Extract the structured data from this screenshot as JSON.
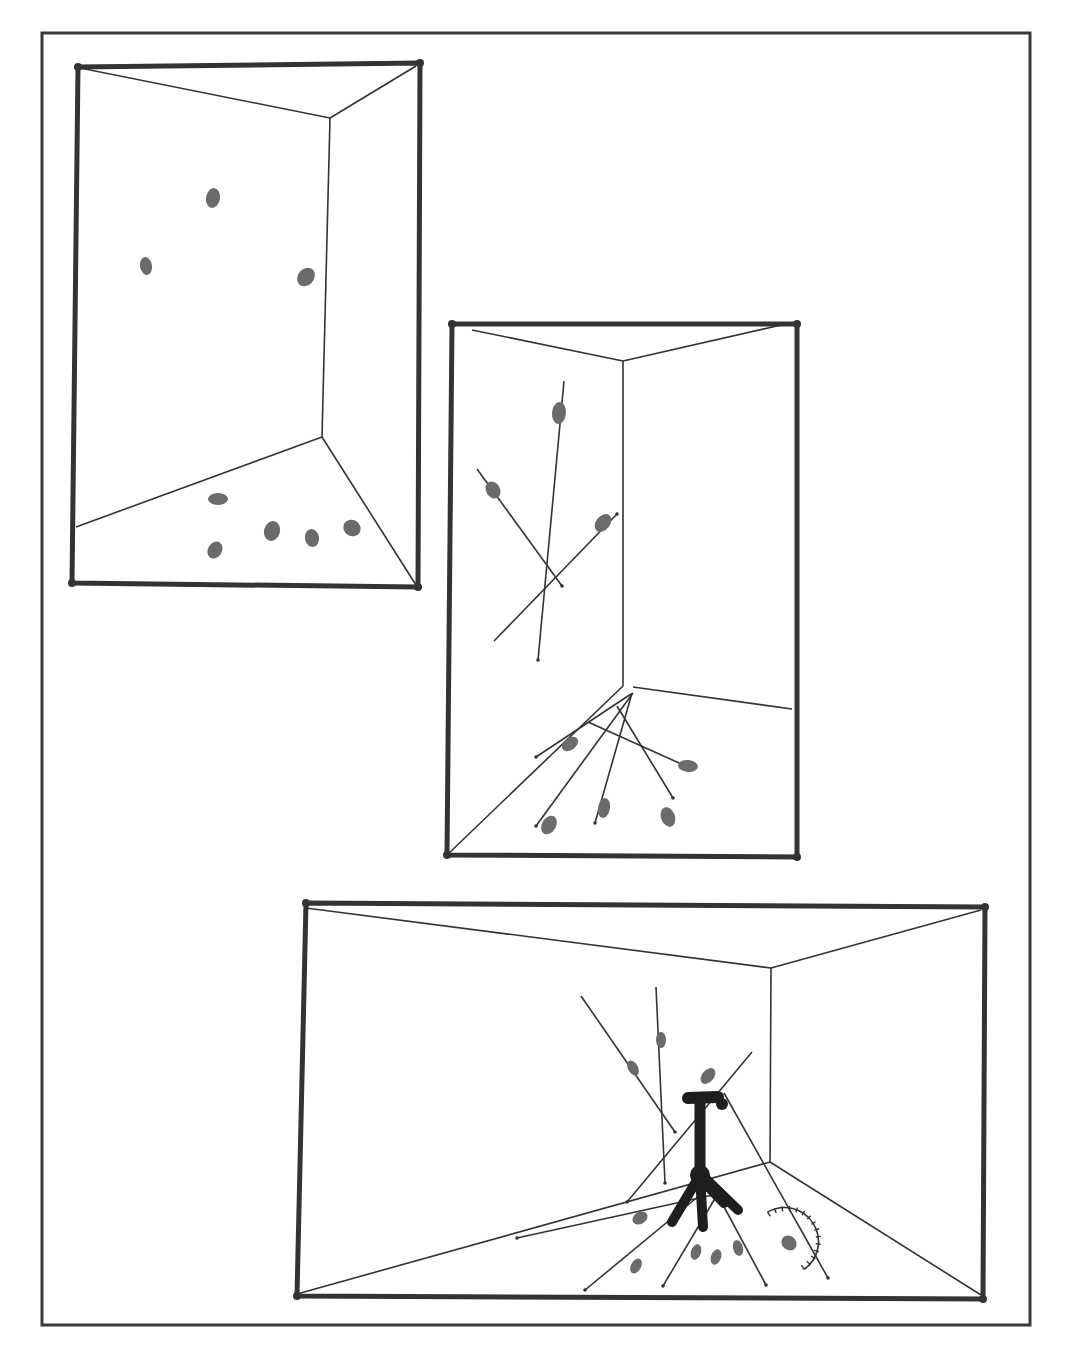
{
  "figure": {
    "width": 1068,
    "height": 1360,
    "background": "#ffffff",
    "ink_color": "#333333",
    "blob_color": "#6b6b6b",
    "outer_border": {
      "x": 42,
      "y": 33,
      "w": 988,
      "h": 1292
    },
    "panels": [
      {
        "id": "panel-1",
        "description": "room corner with scattered particles",
        "frame": [
          [
            78,
            67
          ],
          [
            420,
            63
          ],
          [
            418,
            587
          ],
          [
            72,
            583
          ]
        ],
        "edges": [
          [
            [
              80,
              68
            ],
            [
              330,
              118
            ]
          ],
          [
            [
              330,
              118
            ],
            [
              416,
              66
            ]
          ],
          [
            [
              330,
              118
            ],
            [
              322,
              437
            ]
          ],
          [
            [
              322,
              437
            ],
            [
              76,
              527
            ]
          ],
          [
            [
              322,
              437
            ],
            [
              416,
              585
            ]
          ]
        ],
        "rods": [],
        "blobs": [
          {
            "x": 213,
            "y": 198,
            "rx": 7,
            "ry": 10,
            "rot": 10
          },
          {
            "x": 146,
            "y": 266,
            "rx": 6,
            "ry": 9,
            "rot": -10
          },
          {
            "x": 306,
            "y": 277,
            "rx": 8,
            "ry": 10,
            "rot": 40
          },
          {
            "x": 218,
            "y": 499,
            "rx": 10,
            "ry": 6,
            "rot": 0
          },
          {
            "x": 215,
            "y": 550,
            "rx": 7,
            "ry": 9,
            "rot": 30
          },
          {
            "x": 272,
            "y": 531,
            "rx": 8,
            "ry": 10,
            "rot": 15
          },
          {
            "x": 312,
            "y": 538,
            "rx": 7,
            "ry": 9,
            "rot": -10
          },
          {
            "x": 352,
            "y": 528,
            "rx": 9,
            "ry": 8,
            "rot": 30
          }
        ]
      },
      {
        "id": "panel-2",
        "description": "room corner with particles and trajectories",
        "frame": [
          [
            452,
            324
          ],
          [
            797,
            324
          ],
          [
            797,
            857
          ],
          [
            447,
            855
          ]
        ],
        "edges": [
          [
            [
              472,
              330
            ],
            [
              623,
              361
            ]
          ],
          [
            [
              623,
              361
            ],
            [
              790,
              323
            ]
          ],
          [
            [
              623,
              361
            ],
            [
              623,
              686
            ]
          ],
          [
            [
              623,
              686
            ],
            [
              447,
              855
            ]
          ],
          [
            [
              633,
              687
            ],
            [
              792,
              709
            ]
          ]
        ],
        "rods": [
          [
            [
              564,
              381
            ],
            [
              538,
              660
            ]
          ],
          [
            [
              477,
              469
            ],
            [
              562,
              586
            ]
          ],
          [
            [
              494,
              641
            ],
            [
              617,
              514
            ]
          ],
          [
            [
              588,
              722
            ],
            [
              688,
              767
            ]
          ],
          [
            [
              631,
              694
            ],
            [
              536,
              757
            ]
          ],
          [
            [
              633,
              693
            ],
            [
              536,
              826
            ]
          ],
          [
            [
              632,
              693
            ],
            [
              595,
              823
            ]
          ],
          [
            [
              617,
              706
            ],
            [
              673,
              798
            ]
          ]
        ],
        "blobs": [
          {
            "x": 559,
            "y": 413,
            "rx": 7,
            "ry": 11,
            "rot": 5
          },
          {
            "x": 493,
            "y": 490,
            "rx": 7,
            "ry": 9,
            "rot": -30
          },
          {
            "x": 603,
            "y": 523,
            "rx": 7,
            "ry": 10,
            "rot": 40
          },
          {
            "x": 688,
            "y": 766,
            "rx": 10,
            "ry": 6,
            "rot": 5
          },
          {
            "x": 570,
            "y": 744,
            "rx": 9,
            "ry": 6,
            "rot": -35
          },
          {
            "x": 549,
            "y": 825,
            "rx": 7,
            "ry": 10,
            "rot": 30
          },
          {
            "x": 604,
            "y": 808,
            "rx": 6,
            "ry": 10,
            "rot": 10
          },
          {
            "x": 668,
            "y": 817,
            "rx": 7,
            "ry": 10,
            "rot": -20
          }
        ]
      },
      {
        "id": "panel-3",
        "description": "room corner with tripod, rods, particles and protractor gauge",
        "frame": [
          [
            306,
            903
          ],
          [
            985,
            907
          ],
          [
            983,
            1299
          ],
          [
            297,
            1296
          ]
        ],
        "edges": [
          [
            [
              306,
              908
            ],
            [
              771,
              968
            ]
          ],
          [
            [
              771,
              968
            ],
            [
              981,
              910
            ]
          ],
          [
            [
              771,
              968
            ],
            [
              770,
              1162
            ]
          ],
          [
            [
              770,
              1162
            ],
            [
              297,
              1294
            ]
          ],
          [
            [
              770,
              1162
            ],
            [
              981,
              1295
            ]
          ]
        ],
        "rods": [
          [
            [
              581,
              996
            ],
            [
              675,
              1132
            ]
          ],
          [
            [
              656,
              987
            ],
            [
              665,
              1183
            ]
          ],
          [
            [
              752,
              1052
            ],
            [
              627,
              1202
            ]
          ],
          [
            [
              724,
              1093
            ],
            [
              828,
              1278
            ]
          ],
          [
            [
              713,
              1195
            ],
            [
              517,
              1238
            ]
          ],
          [
            [
              700,
              1195
            ],
            [
              585,
              1290
            ]
          ],
          [
            [
              720,
              1190
            ],
            [
              663,
              1286
            ]
          ],
          [
            [
              715,
              1190
            ],
            [
              766,
              1285
            ]
          ]
        ],
        "blobs": [
          {
            "x": 661,
            "y": 1040,
            "rx": 5,
            "ry": 8,
            "rot": 0
          },
          {
            "x": 633,
            "y": 1068,
            "rx": 5,
            "ry": 8,
            "rot": -30
          },
          {
            "x": 708,
            "y": 1076,
            "rx": 6,
            "ry": 9,
            "rot": 40
          },
          {
            "x": 640,
            "y": 1218,
            "rx": 8,
            "ry": 6,
            "rot": -30
          },
          {
            "x": 716,
            "y": 1257,
            "rx": 5,
            "ry": 8,
            "rot": 20
          },
          {
            "x": 696,
            "y": 1252,
            "rx": 5,
            "ry": 8,
            "rot": 20
          },
          {
            "x": 738,
            "y": 1248,
            "rx": 5,
            "ry": 8,
            "rot": -15
          },
          {
            "x": 789,
            "y": 1243,
            "rx": 8,
            "ry": 7,
            "rot": 40
          },
          {
            "x": 636,
            "y": 1266,
            "rx": 5,
            "ry": 8,
            "rot": 30
          }
        ],
        "tripod": {
          "head": [
            [
              688,
              1098
            ],
            [
              718,
              1097
            ]
          ],
          "head_knob": {
            "x": 722,
            "y": 1104
          },
          "mast": [
            [
              700,
              1100
            ],
            [
              700,
              1170
            ]
          ],
          "hub": {
            "x": 700,
            "y": 1175
          },
          "legs": [
            [
              [
                700,
                1175
              ],
              [
                672,
                1222
              ]
            ],
            [
              [
                700,
                1175
              ],
              [
                703,
                1227
              ]
            ],
            [
              [
                700,
                1178
              ],
              [
                724,
                1203
              ]
            ],
            [
              [
                705,
                1178
              ],
              [
                738,
                1210
              ]
            ]
          ]
        },
        "gauge": {
          "cx": 787,
          "cy": 1240,
          "r": 34,
          "start_deg": -125,
          "end_deg": 60,
          "ticks": 14
        }
      }
    ]
  }
}
